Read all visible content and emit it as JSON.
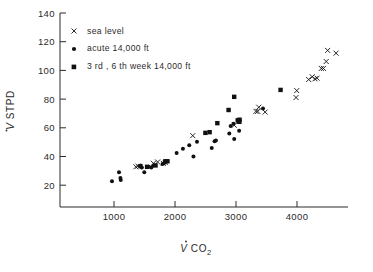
{
  "figure": {
    "name": "ventilation-vs-co2-output-scatter",
    "background": "#ffffff",
    "ink_color": "#1a1a1a"
  },
  "axes": {
    "x": {
      "label_main": "V",
      "label_rest": " CO",
      "label_sub": "2",
      "ticks": [
        1000,
        2000,
        3000,
        4000
      ],
      "tick_labels": [
        "1000",
        "2000",
        "3000",
        "4000"
      ],
      "range": [
        400,
        4500
      ],
      "grid": false
    },
    "y": {
      "label_main": "V",
      "label_rest": " STPD",
      "ticks": [
        20,
        40,
        60,
        80,
        100,
        120,
        140
      ],
      "tick_labels": [
        "20",
        "40",
        "60",
        "80",
        "100",
        "120",
        "140"
      ],
      "range": [
        0,
        140
      ],
      "grid": false
    }
  },
  "legend": {
    "position": "top-left-inside",
    "entries": [
      {
        "marker": "cross",
        "label": "sea level"
      },
      {
        "marker": "dot",
        "label": "acute  14,000 ft"
      },
      {
        "marker": "square",
        "label": "3 rd , 6 th week  14,000 ft"
      }
    ]
  },
  "chart_data": {
    "type": "scatter",
    "title": "",
    "xlabel": "V̇ CO2",
    "ylabel": "V̇ STPD",
    "xlim": [
      400,
      4500
    ],
    "ylim": [
      0,
      140
    ],
    "grid": false,
    "legend_position": "top-left-inside",
    "series": [
      {
        "name": "sea level",
        "marker": "cross",
        "points": [
          [
            1480,
            29.0
          ],
          [
            1510,
            29.5
          ],
          [
            1730,
            31.5
          ],
          [
            1790,
            32.5
          ],
          [
            1870,
            31.5
          ],
          [
            1900,
            32.0
          ],
          [
            2290,
            51.5
          ],
          [
            2880,
            59.0
          ],
          [
            2950,
            62.0
          ],
          [
            3190,
            69.0
          ],
          [
            3215,
            69.0
          ],
          [
            3230,
            72.0
          ],
          [
            3320,
            68.5
          ],
          [
            3760,
            79.0
          ],
          [
            3770,
            84.0
          ],
          [
            3940,
            92.0
          ],
          [
            3990,
            94.0
          ],
          [
            4030,
            92.5
          ],
          [
            4060,
            93.0
          ],
          [
            4120,
            100.0
          ],
          [
            4150,
            100.0
          ],
          [
            4190,
            105.0
          ],
          [
            4210,
            113.0
          ],
          [
            4330,
            111.0
          ]
        ]
      },
      {
        "name": "acute 14,000 ft",
        "marker": "dot",
        "points": [
          [
            1140,
            18.5
          ],
          [
            1240,
            25.0
          ],
          [
            1260,
            21.0
          ],
          [
            1265,
            19.5
          ],
          [
            1565,
            28.5
          ],
          [
            1600,
            25.0
          ],
          [
            1660,
            29.0
          ],
          [
            1700,
            28.5
          ],
          [
            1730,
            30.0
          ],
          [
            1860,
            31.0
          ],
          [
            1880,
            31.5
          ],
          [
            2060,
            39.0
          ],
          [
            2150,
            42.0
          ],
          [
            2240,
            44.5
          ],
          [
            2300,
            36.5
          ],
          [
            2350,
            47.0
          ],
          [
            2560,
            42.5
          ],
          [
            2600,
            47.5
          ],
          [
            2620,
            48.0
          ],
          [
            2810,
            53.0
          ],
          [
            2830,
            58.5
          ],
          [
            2870,
            60.0
          ],
          [
            2880,
            49.0
          ],
          [
            2950,
            55.0
          ],
          [
            2960,
            62.0
          ],
          [
            3290,
            71.0
          ]
        ]
      },
      {
        "name": "3 rd , 6 th week 14,000 ft",
        "marker": "square",
        "points": [
          [
            1545,
            29.5
          ],
          [
            1640,
            29.0
          ],
          [
            1760,
            30.0
          ],
          [
            1900,
            33.0
          ],
          [
            1930,
            33.0
          ],
          [
            2470,
            53.5
          ],
          [
            2530,
            54.0
          ],
          [
            2640,
            60.5
          ],
          [
            2800,
            70.0
          ],
          [
            2880,
            79.5
          ],
          [
            2930,
            62.5
          ],
          [
            2950,
            61.5
          ],
          [
            2955,
            63.0
          ],
          [
            3540,
            84.5
          ]
        ]
      }
    ]
  }
}
